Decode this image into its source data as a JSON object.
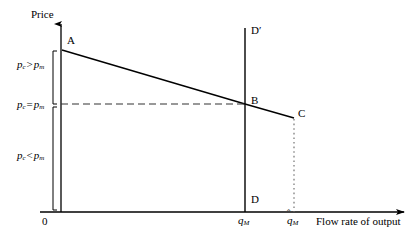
{
  "figure": {
    "axes": {
      "y_title": "Price",
      "x_title": "Flow rate of output",
      "origin_label": "0"
    },
    "price_labels": [
      {
        "id": "above",
        "p": "p",
        "sub_left": "c",
        "relation": ">",
        "p2": "p",
        "sub_right": "m",
        "text": "p_c > p_m"
      },
      {
        "id": "equal",
        "p": "p",
        "sub_left": "c",
        "relation": "=",
        "p2": "p",
        "sub_right": "m",
        "text": "p_c = p_m"
      },
      {
        "id": "below",
        "p": "p",
        "sub_left": "c",
        "relation": "<",
        "p2": "p",
        "sub_right": "m",
        "text": "p_c < p_m"
      }
    ],
    "points": [
      {
        "name": "A",
        "label": "A"
      },
      {
        "name": "B",
        "label": "B"
      },
      {
        "name": "C",
        "label": "C"
      },
      {
        "name": "D",
        "label": "D"
      },
      {
        "name": "D-prime",
        "label": "D′"
      }
    ],
    "quantity_ticks": [
      {
        "id": "q_M",
        "symbol": "q",
        "sub": "M",
        "accent": "",
        "text": "q_M"
      },
      {
        "id": "q_hat_M",
        "symbol": "q",
        "sub": "M",
        "accent": "ˆ",
        "text": "q̂_M"
      }
    ],
    "colors": {
      "line": "#000000",
      "background": "#ffffff",
      "dashed": "#555555",
      "dotted": "#777777"
    }
  }
}
